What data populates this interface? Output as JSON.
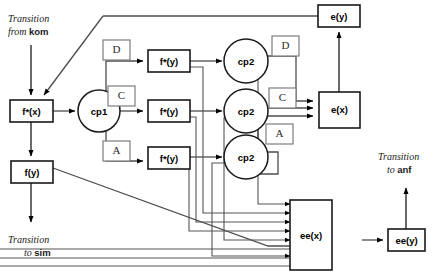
{
  "diagram": {
    "transitions": [
      {
        "id": "from-kom",
        "line1": "Transition",
        "line2_prefix": "from ",
        "line2_bold": "kom"
      },
      {
        "id": "to-sim",
        "line1": "Transition",
        "line2_prefix": "to ",
        "line2_bold": "sim"
      },
      {
        "id": "to-anf",
        "line1": "Transition",
        "line2_prefix": "to ",
        "line2_bold": "anf"
      }
    ],
    "nodes": [
      {
        "id": "fx",
        "label": "f*(x)",
        "shape": "box"
      },
      {
        "id": "fy",
        "label": "f(y)",
        "shape": "box"
      },
      {
        "id": "cp1",
        "label": "cp1",
        "shape": "circle"
      },
      {
        "id": "fsy-top",
        "label": "f*(y)",
        "shape": "box"
      },
      {
        "id": "fsy-mid",
        "label": "f*(y)",
        "shape": "box"
      },
      {
        "id": "fsy-bot",
        "label": "f*(y)",
        "shape": "box"
      },
      {
        "id": "cp2-top",
        "label": "cp2",
        "shape": "circle"
      },
      {
        "id": "cp2-mid",
        "label": "cp2",
        "shape": "circle"
      },
      {
        "id": "cp2-bot",
        "label": "cp2",
        "shape": "circle"
      },
      {
        "id": "ey",
        "label": "e(y)",
        "shape": "box"
      },
      {
        "id": "ex",
        "label": "e(x)",
        "shape": "box"
      },
      {
        "id": "eex",
        "label": "ee(x)",
        "shape": "box"
      },
      {
        "id": "eey",
        "label": "ee(y)",
        "shape": "box"
      }
    ],
    "annotations": [
      {
        "id": "left-d",
        "label": "D"
      },
      {
        "id": "left-c",
        "label": "C"
      },
      {
        "id": "left-a",
        "label": "A"
      },
      {
        "id": "right-d",
        "label": "D"
      },
      {
        "id": "right-c",
        "label": "C"
      },
      {
        "id": "right-a",
        "label": "A"
      }
    ],
    "colors": {
      "background": "#ffffff",
      "node_stroke": "#1a1a1a",
      "label_stroke": "#7d7d7d",
      "edge": "#4d4d4d",
      "text": "#000000"
    }
  }
}
